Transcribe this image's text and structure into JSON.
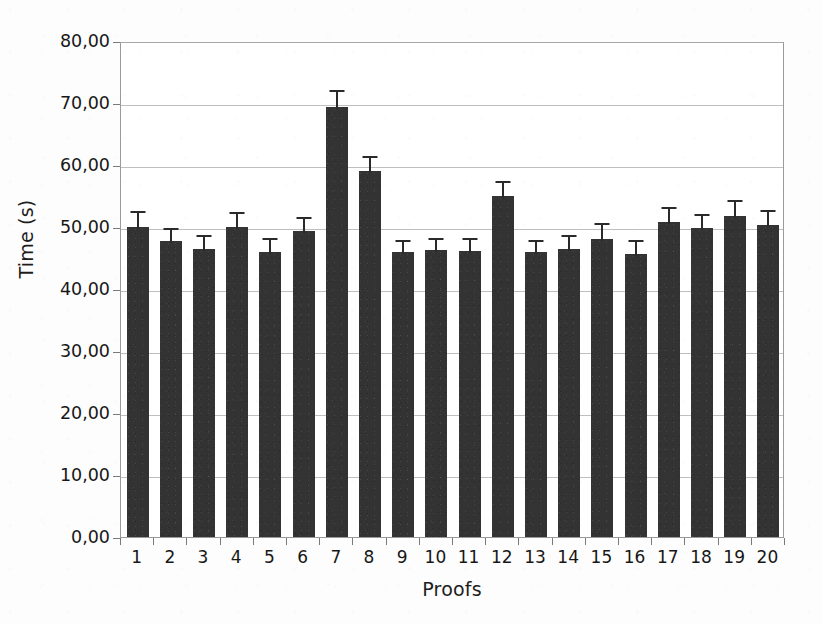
{
  "chart_data": {
    "type": "bar",
    "title": "",
    "xlabel": "Proofs",
    "ylabel": "Time (s)",
    "ylim": [
      0,
      80
    ],
    "ytick_step": 10,
    "ytick_labels": [
      "80,00",
      "70,00",
      "60,00",
      "50,00",
      "40,00",
      "30,00",
      "20,00",
      "10,00",
      "0,00"
    ],
    "ytick_values": [
      80,
      70,
      60,
      50,
      40,
      30,
      20,
      10,
      0
    ],
    "categories": [
      "1",
      "2",
      "3",
      "4",
      "5",
      "6",
      "7",
      "8",
      "9",
      "10",
      "11",
      "12",
      "13",
      "14",
      "15",
      "16",
      "17",
      "18",
      "19",
      "20"
    ],
    "values": [
      50.0,
      47.8,
      46.4,
      50.0,
      46.0,
      49.3,
      69.3,
      59.0,
      46.0,
      46.3,
      46.2,
      55.0,
      45.9,
      46.4,
      48.0,
      45.7,
      50.8,
      49.8,
      51.7,
      50.3
    ],
    "errors": [
      2.9,
      2.4,
      2.6,
      2.7,
      2.6,
      2.6,
      3.1,
      2.8,
      2.3,
      2.3,
      2.3,
      2.8,
      2.3,
      2.6,
      3.0,
      2.6,
      2.7,
      2.6,
      3.0,
      2.8
    ],
    "error_direction": "upper",
    "grid": true,
    "grid_axis": "y",
    "legend": false,
    "bar_color": "#333333",
    "grid_color": "#bfbfbf",
    "axis_color": "#9a9a9a",
    "background_color": "#ffffff"
  }
}
